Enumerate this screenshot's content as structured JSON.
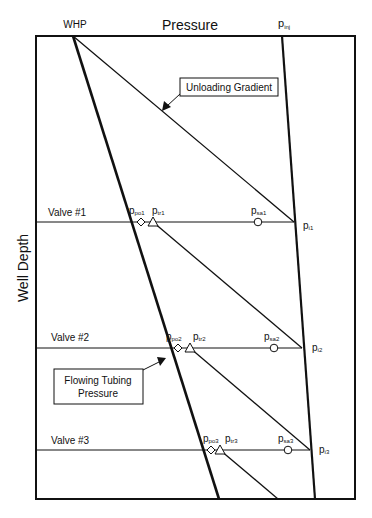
{
  "title": "Pressure",
  "top_left_label": "WHP",
  "top_right_label": {
    "base": "p",
    "sub": "inj"
  },
  "y_axis_label": "Well Depth",
  "callouts": {
    "unloading": "Unloading Gradient",
    "flowing_line1": "Flowing Tubing",
    "flowing_line2": "Pressure"
  },
  "valves": [
    {
      "label": "Valve #1",
      "ppo": {
        "base": "p",
        "sub": "po1"
      },
      "ptr": {
        "base": "p",
        "sub": "tr1"
      },
      "psa": {
        "base": "p",
        "sub": "sa1"
      },
      "pi": {
        "base": "p",
        "sub": "i1"
      }
    },
    {
      "label": "Valve #2",
      "ppo": {
        "base": "p",
        "sub": "po2"
      },
      "ptr": {
        "base": "p",
        "sub": "tr2"
      },
      "psa": {
        "base": "p",
        "sub": "sa2"
      },
      "pi": {
        "base": "p",
        "sub": "i2"
      }
    },
    {
      "label": "Valve #3",
      "ppo": {
        "base": "p",
        "sub": "po3"
      },
      "ptr": {
        "base": "p",
        "sub": "tr3"
      },
      "psa": {
        "base": "p",
        "sub": "sa3"
      },
      "pi": {
        "base": "p",
        "sub": "i3"
      }
    }
  ],
  "legend_markers": {
    "diamond": "valve opening pressure (p_po)",
    "triangle": "transfer pressure (p_tr)",
    "circle": "surface-set pressure (p_sa)"
  }
}
